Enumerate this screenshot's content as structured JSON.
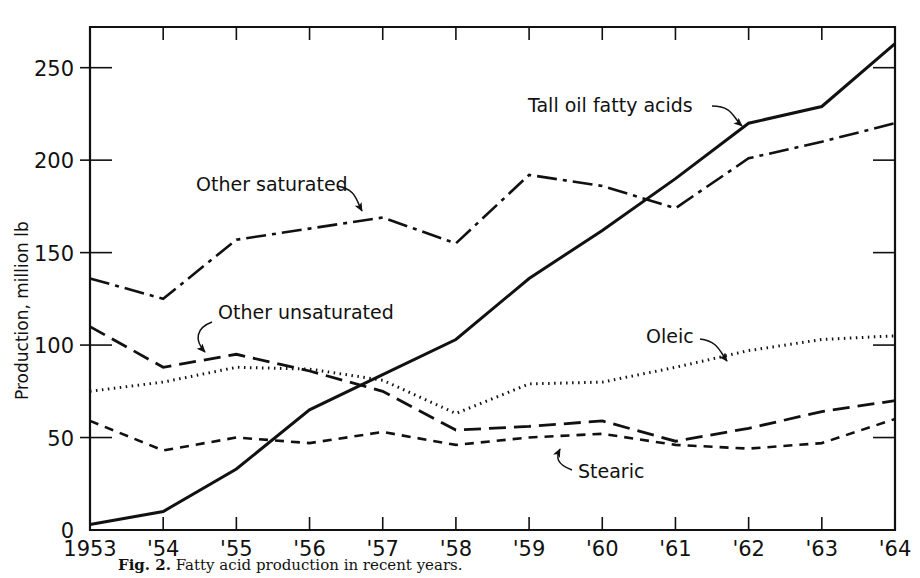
{
  "figure": {
    "caption_label": "Fig. 2.",
    "caption_text": "Fatty acid production in recent years."
  },
  "chart_data": {
    "type": "line",
    "title": "",
    "xlabel": "",
    "ylabel": "Production, million lb",
    "xlim": [
      1953,
      1964
    ],
    "ylim": [
      0,
      272
    ],
    "grid": false,
    "legend": "annotations-on-plot",
    "x": [
      1953,
      1954,
      1955,
      1956,
      1957,
      1958,
      1959,
      1960,
      1961,
      1962,
      1963,
      1964
    ],
    "xticklabels": [
      "1953",
      "'54",
      "'55",
      "'56",
      "'57",
      "'58",
      "'59",
      "'60",
      "'61",
      "'62",
      "'63",
      "'64"
    ],
    "yticks": [
      0,
      50,
      100,
      150,
      200,
      250
    ],
    "yticklabels": [
      "0",
      "50",
      "100",
      "150",
      "200",
      "250"
    ],
    "series": [
      {
        "name": "Tall oil fatty acids",
        "style": "solid",
        "label_text": "Tall oil fatty acids",
        "values": [
          3,
          10,
          33,
          65,
          84,
          103,
          136,
          162,
          190,
          220,
          229,
          263
        ]
      },
      {
        "name": "Other saturated",
        "style": "dash-dot",
        "label_text": "Other saturated",
        "values": [
          136,
          125,
          157,
          163,
          169,
          155,
          192,
          186,
          174,
          201,
          210,
          220
        ]
      },
      {
        "name": "Other unsaturated",
        "style": "long-dash",
        "label_text": "Other unsaturated",
        "values": [
          110,
          88,
          95,
          86,
          75,
          54,
          56,
          59,
          48,
          55,
          64,
          70
        ]
      },
      {
        "name": "Oleic",
        "style": "dotted",
        "label_text": "Oleic",
        "values": [
          75,
          80,
          88,
          87,
          81,
          63,
          79,
          80,
          88,
          97,
          103,
          105
        ]
      },
      {
        "name": "Stearic",
        "style": "short-dash",
        "label_text": "Stearic",
        "values": [
          59,
          43,
          50,
          47,
          53,
          46,
          50,
          52,
          46,
          44,
          47,
          60
        ]
      }
    ],
    "annotations": [
      {
        "id": "tall-oil-fatty-acids",
        "text": "Tall oil fatty acids",
        "points_to_year": 1962
      },
      {
        "id": "other-saturated",
        "text": "Other saturated",
        "points_to_year": 1957
      },
      {
        "id": "other-unsaturated",
        "text": "Other unsaturated",
        "points_to_year": 1955
      },
      {
        "id": "oleic",
        "text": "Oleic",
        "points_to_year": 1962
      },
      {
        "id": "stearic",
        "text": "Stearic",
        "points_to_year": 1960
      }
    ]
  },
  "colors": {
    "ink": "#111111",
    "paper": "#ffffff"
  }
}
